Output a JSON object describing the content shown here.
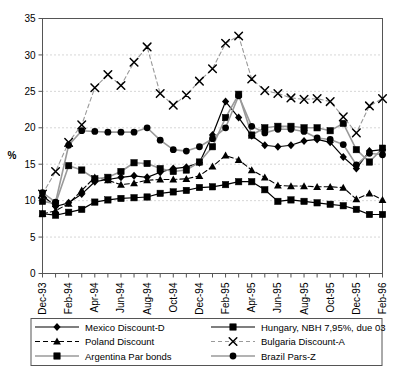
{
  "chart_data": {
    "type": "line",
    "title": "",
    "xlabel": "",
    "ylabel": "%",
    "ylim": [
      0,
      35
    ],
    "ytick_step": 5,
    "yticks": [
      "0",
      "5",
      "10",
      "15",
      "20",
      "25",
      "30",
      "35"
    ],
    "grid": true,
    "grid_style": "dotted-horizontal",
    "legend_position": "bottom",
    "x": [
      "Dec-93",
      "Jan-94",
      "Feb-94",
      "Mar-94",
      "Apr-94",
      "May-94",
      "Jun-94",
      "Jul-94",
      "Aug-94",
      "Sep-94",
      "Oct-94",
      "Nov-94",
      "Dec-94",
      "Jan-95",
      "Feb-95",
      "Mar-95",
      "Apr-95",
      "May-95",
      "Jun-95",
      "Jul-95",
      "Aug-95",
      "Sep-95",
      "Oct-95",
      "Nov-95",
      "Dec-95",
      "Jan-96",
      "Feb-96"
    ],
    "xtick_labels": [
      "Dec-93",
      "Feb-94",
      "Apr-94",
      "Jun-94",
      "Aug-94",
      "Oct-94",
      "Dec-94",
      "Feb-95",
      "Apr-95",
      "Jun-95",
      "Aug-95",
      "Oct-95",
      "Dec-95",
      "Feb-96"
    ],
    "xtick_indices": [
      0,
      2,
      4,
      6,
      8,
      10,
      12,
      14,
      16,
      18,
      20,
      22,
      24,
      26
    ],
    "series": [
      {
        "name": "Mexico Discount-D",
        "marker": "diamond",
        "line": "solid",
        "color": "#000000",
        "values": [
          10.7,
          9.2,
          9.7,
          10.9,
          12.6,
          12.9,
          13.2,
          13.4,
          13.2,
          13.9,
          14.4,
          14.6,
          15.2,
          19.0,
          23.6,
          21.4,
          18.9,
          17.6,
          17.4,
          17.6,
          18.2,
          18.4,
          18.0,
          16.0,
          14.4,
          16.8,
          17.0
        ]
      },
      {
        "name": "Poland Discount",
        "marker": "triangle",
        "line": "dashed",
        "color": "#000000",
        "values": [
          8.2,
          8.6,
          9.6,
          11.4,
          13.2,
          12.8,
          12.2,
          12.4,
          12.8,
          12.9,
          12.9,
          13.0,
          13.4,
          14.7,
          16.2,
          15.6,
          14.2,
          13.2,
          12.1,
          12.0,
          12.0,
          11.9,
          11.9,
          11.8,
          10.2,
          11.0,
          10.1
        ]
      },
      {
        "name": "Argentina Par bonds",
        "marker": "square",
        "line": "solid-light",
        "color": "#808080",
        "values": [
          9.9,
          9.6,
          14.8,
          14.2,
          13.0,
          13.2,
          14.0,
          15.2,
          15.1,
          14.4,
          14.0,
          14.2,
          15.3,
          17.4,
          21.4,
          24.6,
          19.0,
          20.0,
          20.2,
          20.2,
          20.0,
          20.0,
          19.6,
          20.6,
          17.0,
          15.3,
          17.2
        ]
      },
      {
        "name": "Hungary, NBH 7,95%, due 03",
        "marker": "square",
        "line": "solid",
        "color": "#000000",
        "values": [
          8.2,
          8.0,
          8.4,
          8.8,
          9.8,
          10.1,
          10.3,
          10.4,
          10.5,
          11.0,
          11.2,
          11.4,
          11.8,
          11.9,
          12.2,
          12.6,
          12.6,
          11.5,
          9.9,
          10.1,
          9.9,
          9.7,
          9.5,
          9.3,
          8.8,
          8.1,
          8.1
        ]
      },
      {
        "name": "Bulgaria Discount-A",
        "marker": "x",
        "line": "dashed-light",
        "color": "#808080",
        "values": [
          10.9,
          14.0,
          18.0,
          20.4,
          25.5,
          27.3,
          25.8,
          29.0,
          31.1,
          24.7,
          23.1,
          24.5,
          26.4,
          28.1,
          31.6,
          32.6,
          26.7,
          25.1,
          24.7,
          24.1,
          23.9,
          24.0,
          23.6,
          21.5,
          19.3,
          23.0,
          24.0
        ]
      },
      {
        "name": "Brazil Pars-Z",
        "marker": "circle",
        "line": "solid-light",
        "color": "#808080",
        "values": [
          11.1,
          9.8,
          17.6,
          19.6,
          19.5,
          19.4,
          19.4,
          19.4,
          20.0,
          18.3,
          17.0,
          16.8,
          17.4,
          18.5,
          20.0,
          24.4,
          20.2,
          19.3,
          19.8,
          19.8,
          19.5,
          18.6,
          18.4,
          17.7,
          14.9,
          16.5,
          16.3
        ]
      }
    ]
  },
  "legend": {
    "items": [
      {
        "label": "Mexico Discount-D"
      },
      {
        "label": "Poland Discount"
      },
      {
        "label": "Argentina Par bonds"
      },
      {
        "label": "Hungary, NBH 7,95%, due 03"
      },
      {
        "label": "Bulgaria Discount-A"
      },
      {
        "label": "Brazil Pars-Z"
      }
    ]
  },
  "colors": {
    "axis": "#555555",
    "grid": "#999999",
    "black": "#000000",
    "gray": "#808080",
    "background": "#ffffff"
  }
}
